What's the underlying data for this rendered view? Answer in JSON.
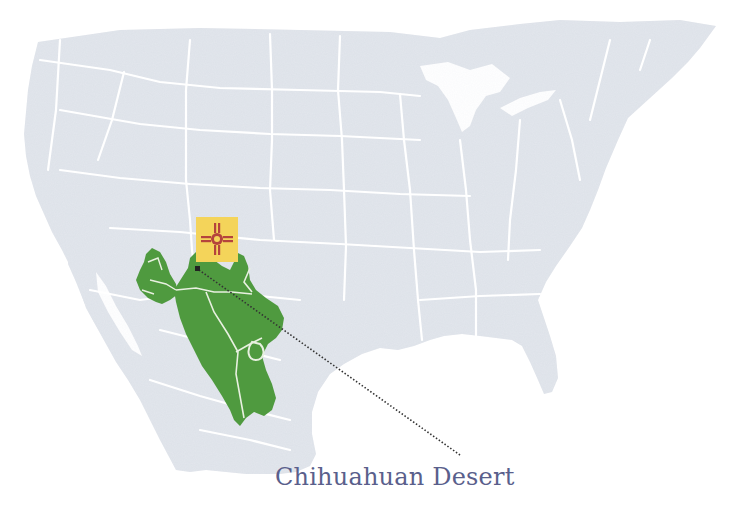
{
  "map": {
    "subject": "North America (United States and Mexico)",
    "highlighted_region": "Chihuahuan Desert",
    "marker": {
      "type": "state-flag",
      "description": "New Mexico flag (red Zia sun symbol on yellow)",
      "position": {
        "x": 217,
        "y": 239
      }
    },
    "pointer": {
      "style": "dotted-arrow",
      "from": {
        "x": 460,
        "y": 455
      },
      "to": {
        "x": 197,
        "y": 269
      }
    },
    "colors": {
      "land": "#dde1e8",
      "borders": "#ffffff",
      "desert": "#4f9a3f",
      "flag_bg": "#f4d45a",
      "flag_symbol": "#b5443c",
      "caption": "#5a5f8c",
      "pointer": "#333333"
    }
  },
  "caption": {
    "text": "Chihuahuan Desert"
  }
}
